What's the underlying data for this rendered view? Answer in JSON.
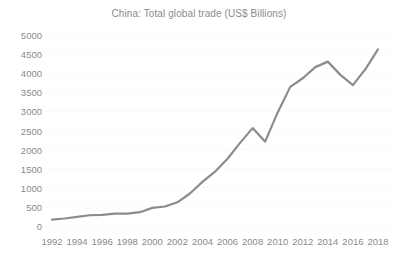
{
  "chart_data": {
    "type": "line",
    "title": "China: Total global trade (US$ Billions)",
    "xlabel": "",
    "ylabel": "",
    "ylim": [
      0,
      5000
    ],
    "ytick_values": [
      0,
      500,
      1000,
      1500,
      2000,
      2500,
      3000,
      3500,
      4000,
      4500,
      5000
    ],
    "ytick_labels": [
      "0",
      "500",
      "1000",
      "1500",
      "2000",
      "2500",
      "3000",
      "3500",
      "4000",
      "4500",
      "5000"
    ],
    "xlim": [
      1992,
      2018
    ],
    "xtick_values": [
      1992,
      1994,
      1996,
      1998,
      2000,
      2002,
      2004,
      2006,
      2008,
      2010,
      2012,
      2014,
      2016,
      2018
    ],
    "xtick_labels": [
      "1992",
      "1994",
      "1996",
      "1998",
      "2000",
      "2002",
      "2004",
      "2006",
      "2008",
      "2010",
      "2012",
      "2014",
      "2016",
      "2018"
    ],
    "grid": true,
    "grid_axis": "y",
    "legend": false,
    "legend_position": "none",
    "series": [
      {
        "name": "Total global trade",
        "color": "#8c8c8c",
        "x": [
          1992,
          1993,
          1994,
          1995,
          1996,
          1997,
          1998,
          1999,
          2000,
          2001,
          2002,
          2003,
          2004,
          2005,
          2006,
          2007,
          2008,
          2009,
          2010,
          2011,
          2012,
          2013,
          2014,
          2015,
          2016,
          2017,
          2018
        ],
        "values": [
          166,
          196,
          237,
          281,
          290,
          325,
          324,
          361,
          474,
          510,
          621,
          851,
          1155,
          1422,
          1760,
          2176,
          2563,
          2208,
          2974,
          3642,
          3867,
          4159,
          4303,
          3956,
          3686,
          4107,
          4623
        ]
      }
    ]
  },
  "style": {
    "line_color": "#8c8c8c",
    "grid_color": "#fafafa",
    "text_color": "#8a8a8a",
    "background": "#ffffff",
    "line_width": 2.2
  }
}
